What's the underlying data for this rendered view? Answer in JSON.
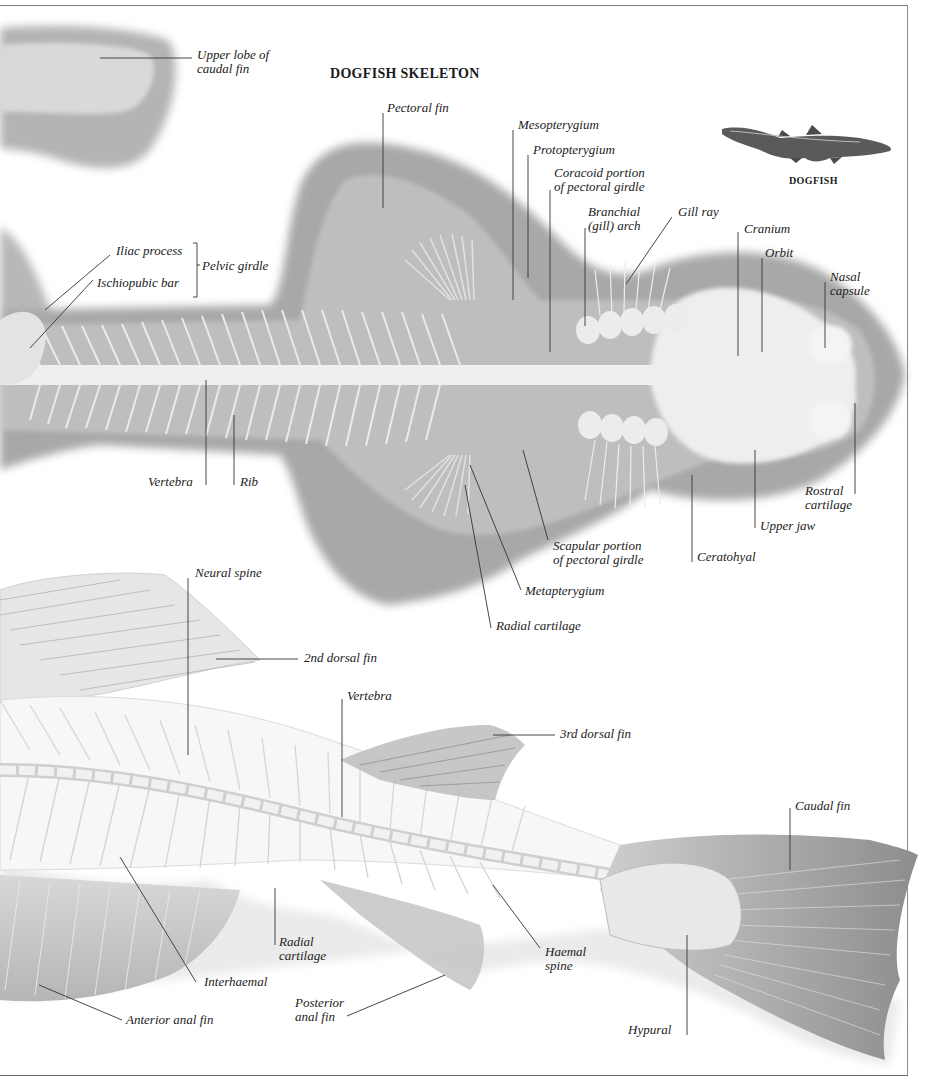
{
  "title": "DOGFISH SKELETON",
  "inset": {
    "caption": "DOGFISH",
    "icon": "dogfish-illustration"
  },
  "colors": {
    "frame": "#7a7a7a",
    "shadow": "#a9a9a9",
    "bone": "#f2f2f2",
    "leader": "#333333",
    "text": "#222222"
  },
  "dogfish_labels": {
    "upper_lobe_1": "Upper lobe of",
    "upper_lobe_2": "caudal fin",
    "pectoral_fin": "Pectoral fin",
    "mesopterygium": "Mesopterygium",
    "protopterygium": "Protopterygium",
    "coracoid_1": "Coracoid portion",
    "coracoid_2": "of pectoral girdle",
    "branchial_1": "Branchial",
    "branchial_2": "(gill) arch",
    "gill_ray": "Gill ray",
    "cranium": "Cranium",
    "orbit": "Orbit",
    "nasal_1": "Nasal",
    "nasal_2": "capsule",
    "iliac_process": "Iliac process",
    "ischiopubic_bar": "Ischiopubic bar",
    "pelvic_girdle": "Pelvic girdle",
    "vertebra": "Vertebra",
    "rib": "Rib",
    "rostral_1": "Rostral",
    "rostral_2": "cartilage",
    "upper_jaw": "Upper jaw",
    "ceratohyal": "Ceratohyal",
    "scapular_1": "Scapular portion",
    "scapular_2": "of pectoral girdle",
    "metapterygium": "Metapterygium",
    "radial_cartilage": "Radial cartilage"
  },
  "bony_fish_labels": {
    "neural_spine": "Neural spine",
    "second_dorsal_fin": "2nd dorsal fin",
    "vertebra": "Vertebra",
    "third_dorsal_fin": "3rd dorsal fin",
    "caudal_fin": "Caudal fin",
    "radial_1": "Radial",
    "radial_2": "cartilage",
    "haemal_1": "Haemal",
    "haemal_2": "spine",
    "interhaemal": "Interhaemal",
    "posterior_1": "Posterior",
    "posterior_2": "anal fin",
    "anterior_anal_fin": "Anterior anal fin",
    "hypural": "Hypural"
  }
}
